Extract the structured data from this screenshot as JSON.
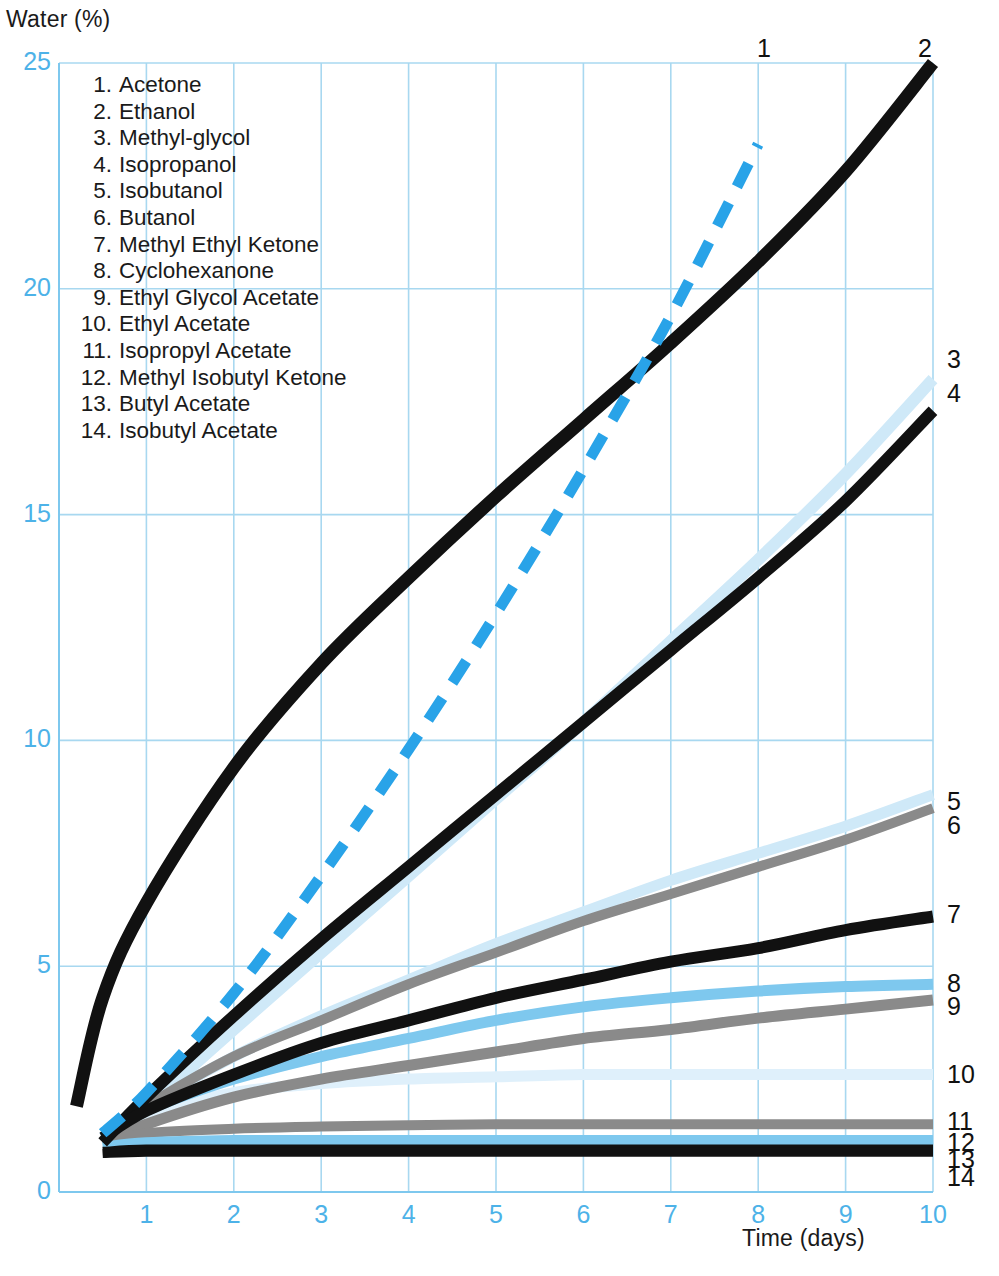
{
  "axes": {
    "y_title": "Water (%)",
    "x_title": "Time (days)",
    "y_ticks": [
      "0",
      "5",
      "10",
      "15",
      "20",
      "25"
    ],
    "x_ticks": [
      "1",
      "2",
      "3",
      "4",
      "5",
      "6",
      "7",
      "8",
      "9",
      "10"
    ],
    "tick_color": "#4db2e8",
    "grid_color": "#a8d8f0"
  },
  "legend": {
    "items": [
      {
        "num": "1.",
        "label": "Acetone"
      },
      {
        "num": "2.",
        "label": "Ethanol"
      },
      {
        "num": "3.",
        "label": "Methyl-glycol"
      },
      {
        "num": "4.",
        "label": "Isopropanol"
      },
      {
        "num": "5.",
        "label": "Isobutanol"
      },
      {
        "num": "6.",
        "label": "Butanol"
      },
      {
        "num": "7.",
        "label": "Methyl Ethyl Ketone"
      },
      {
        "num": "8.",
        "label": "Cyclohexanone"
      },
      {
        "num": "9.",
        "label": "Ethyl Glycol Acetate"
      },
      {
        "num": "10.",
        "label": "Ethyl Acetate"
      },
      {
        "num": "11.",
        "label": "Isopropyl Acetate"
      },
      {
        "num": "12.",
        "label": "Methyl Isobutyl Ketone"
      },
      {
        "num": "13.",
        "label": "Butyl Acetate"
      },
      {
        "num": "14.",
        "label": "Isobutyl Acetate"
      }
    ]
  },
  "curve_labels": [
    {
      "text": "1",
      "x": 757,
      "y": 34
    },
    {
      "text": "2",
      "x": 918,
      "y": 34
    },
    {
      "text": "3",
      "x": 947,
      "y": 345
    },
    {
      "text": "4",
      "x": 947,
      "y": 379
    },
    {
      "text": "5",
      "x": 947,
      "y": 787
    },
    {
      "text": "6",
      "x": 947,
      "y": 811
    },
    {
      "text": "7",
      "x": 947,
      "y": 900
    },
    {
      "text": "8",
      "x": 947,
      "y": 969
    },
    {
      "text": "9",
      "x": 947,
      "y": 992
    },
    {
      "text": "10",
      "x": 947,
      "y": 1060
    },
    {
      "text": "11",
      "x": 947,
      "y": 1107
    },
    {
      "text": "12",
      "x": 947,
      "y": 1128
    },
    {
      "text": "13",
      "x": 947,
      "y": 1145
    },
    {
      "text": "14",
      "x": 947,
      "y": 1163
    }
  ],
  "chart_data": {
    "type": "line",
    "title": "",
    "xlabel": "Time (days)",
    "ylabel": "Water (%)",
    "xlim": [
      0,
      10
    ],
    "ylim": [
      0,
      25
    ],
    "grid": true,
    "legend_position": "inside-top-left",
    "x": [
      0.2,
      0.5,
      1,
      2,
      3,
      4,
      5,
      6,
      7,
      8,
      9,
      10
    ],
    "series": [
      {
        "id": 1,
        "name": "Acetone",
        "color": "#29a3e8",
        "style": "dashed",
        "width": 11,
        "values": [
          null,
          1.3,
          2.2,
          4.4,
          7.0,
          9.8,
          12.8,
          16.0,
          19.4,
          23.2,
          null,
          null
        ]
      },
      {
        "id": 2,
        "name": "Ethanol",
        "color": "#111111",
        "style": "solid",
        "width": 13,
        "values": [
          1.9,
          4.3,
          6.4,
          9.4,
          11.7,
          13.6,
          15.4,
          17.1,
          18.8,
          20.6,
          22.6,
          25.0
        ]
      },
      {
        "id": 3,
        "name": "Methyl-glycol",
        "color": "#cfe9f8",
        "style": "solid",
        "width": 12,
        "values": [
          null,
          1.2,
          1.9,
          3.6,
          5.3,
          7.0,
          8.7,
          10.4,
          12.2,
          14.0,
          15.9,
          18.0
        ]
      },
      {
        "id": 4,
        "name": "Isopropanol",
        "color": "#111111",
        "style": "solid",
        "width": 12,
        "values": [
          null,
          1.1,
          2.1,
          3.9,
          5.6,
          7.2,
          8.8,
          10.4,
          12.0,
          13.6,
          15.3,
          17.3
        ]
      },
      {
        "id": 5,
        "name": "Isobutanol",
        "color": "#cfe9f8",
        "style": "solid",
        "width": 11,
        "values": [
          null,
          1.2,
          1.9,
          3.0,
          3.9,
          4.7,
          5.5,
          6.2,
          6.9,
          7.5,
          8.1,
          8.8
        ]
      },
      {
        "id": 6,
        "name": "Butanol",
        "color": "#8a8a8a",
        "style": "solid",
        "width": 10,
        "values": [
          null,
          1.2,
          1.9,
          3.0,
          3.8,
          4.6,
          5.3,
          6.0,
          6.6,
          7.2,
          7.8,
          8.5
        ]
      },
      {
        "id": 7,
        "name": "Methyl Ethyl Ketone",
        "color": "#111111",
        "style": "solid",
        "width": 12,
        "values": [
          null,
          1.2,
          1.8,
          2.6,
          3.3,
          3.8,
          4.3,
          4.7,
          5.1,
          5.4,
          5.8,
          6.1
        ]
      },
      {
        "id": 8,
        "name": "Cyclohexanone",
        "color": "#7ec8ee",
        "style": "solid",
        "width": 11,
        "values": [
          null,
          1.2,
          1.8,
          2.5,
          3.0,
          3.4,
          3.8,
          4.1,
          4.3,
          4.45,
          4.55,
          4.6
        ]
      },
      {
        "id": 9,
        "name": "Ethyl Glycol Acetate",
        "color": "#8a8a8a",
        "style": "solid",
        "width": 11,
        "values": [
          null,
          1.1,
          1.5,
          2.1,
          2.5,
          2.8,
          3.1,
          3.4,
          3.6,
          3.85,
          4.05,
          4.25
        ]
      },
      {
        "id": 10,
        "name": "Ethyl Acetate",
        "color": "#dff0fb",
        "style": "solid",
        "width": 11,
        "values": [
          null,
          1.2,
          1.7,
          2.2,
          2.4,
          2.5,
          2.55,
          2.6,
          2.6,
          2.6,
          2.6,
          2.6
        ]
      },
      {
        "id": 11,
        "name": "Isopropyl Acetate",
        "color": "#8a8a8a",
        "style": "solid",
        "width": 10,
        "values": [
          null,
          1.1,
          1.3,
          1.4,
          1.45,
          1.48,
          1.5,
          1.5,
          1.5,
          1.5,
          1.5,
          1.5
        ]
      },
      {
        "id": 12,
        "name": "Methyl Isobutyl Ketone",
        "color": "#7ec8ee",
        "style": "solid",
        "width": 10,
        "values": [
          null,
          1.0,
          1.1,
          1.15,
          1.15,
          1.15,
          1.15,
          1.15,
          1.15,
          1.15,
          1.15,
          1.15
        ]
      },
      {
        "id": 13,
        "name": "Butyl Acetate",
        "color": "#111111",
        "style": "solid",
        "width": 9,
        "values": [
          null,
          0.9,
          0.95,
          0.95,
          0.95,
          0.95,
          0.95,
          0.95,
          0.95,
          0.95,
          0.95,
          0.95
        ]
      },
      {
        "id": 14,
        "name": "Isobutyl Acetate",
        "color": "#111111",
        "style": "solid",
        "width": 9,
        "values": [
          null,
          0.85,
          0.88,
          0.88,
          0.88,
          0.88,
          0.88,
          0.88,
          0.88,
          0.88,
          0.88,
          0.88
        ]
      }
    ]
  },
  "plot_geometry": {
    "left": 59,
    "right": 933,
    "top": 63,
    "bottom": 1192
  }
}
